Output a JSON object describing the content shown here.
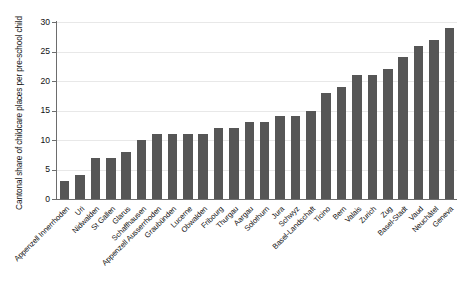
{
  "chart_data": {
    "type": "bar",
    "title": "",
    "subtitle": "",
    "xlabel": "",
    "ylabel": "Cantonal share of childcare places per pre-school child",
    "ylim": [
      0,
      30
    ],
    "yticks": [
      0,
      5,
      10,
      15,
      20,
      25,
      30
    ],
    "grid": true,
    "legend": null,
    "orientation": "vertical",
    "bar_color": "#565656",
    "background_color": "#ffffff",
    "axis_color": "#6d6d6d",
    "gridline_color": "#e8e8e8",
    "categories": [
      "Appenzell Innerrhoden",
      "Uri",
      "Nidwalden",
      "St Gallen",
      "Glarus",
      "Schaffhausen",
      "Appenzell Ausserrhoden",
      "Graubünden",
      "Lucerne",
      "Obwalden",
      "Fribourg",
      "Thurgau",
      "Aargau",
      "Solothurn",
      "Jura",
      "Schwyz",
      "Basel-Landschaft",
      "Ticino",
      "Bern",
      "Valais",
      "Zurich",
      "Zug",
      "Basel-Stadt",
      "Vaud",
      "Neuchâtel",
      "Geneva"
    ],
    "values": [
      3,
      4,
      7,
      7,
      8,
      10,
      11,
      11,
      11,
      11,
      12,
      12,
      13,
      13,
      14,
      14,
      15,
      18,
      19,
      21,
      21,
      22,
      24,
      26,
      27,
      29
    ]
  }
}
